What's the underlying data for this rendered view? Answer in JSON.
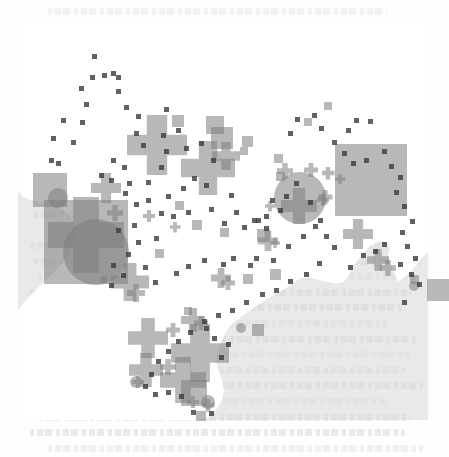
{
  "document": {
    "type": "scanned-journal-page",
    "background_color": "#fefefe",
    "text_ink_color": "#c9c9c9",
    "description": "Faint scanned body text visible above, behind and below the map figure"
  },
  "figure": {
    "title": "",
    "caption": "",
    "region": "Australia",
    "panel": {
      "x": 18,
      "y": 20,
      "width": 410,
      "height": 400,
      "ocean_color": "#d7d7d7",
      "land_color": "#ffffff",
      "opacity": 0.55
    },
    "legend_note": "three overlapping symbol classes: square, circle, cross"
  },
  "chart_data": {
    "type": "scatter",
    "title": "",
    "subtitle": "",
    "xlabel": "",
    "ylabel": "",
    "xlim": [
      0,
      410
    ],
    "ylim": [
      0,
      400
    ],
    "grid": false,
    "legend_position": "none",
    "basemap": "Australia coastline (land white, surround grey)",
    "marker_color": "#7d7d7d",
    "marker_opacity": 0.55,
    "dot_color": "#3b3b3b",
    "series": [
      {
        "name": "square",
        "shape": "square",
        "points": [
          {
            "x": 32,
            "y": 170,
            "size": 34
          },
          {
            "x": 160,
            "y": 101,
            "size": 12
          },
          {
            "x": 197,
            "y": 105,
            "size": 18
          },
          {
            "x": 204,
            "y": 118,
            "size": 22
          },
          {
            "x": 229,
            "y": 121,
            "size": 11
          },
          {
            "x": 226,
            "y": 131,
            "size": 8
          },
          {
            "x": 179,
            "y": 205,
            "size": 10
          },
          {
            "x": 206,
            "y": 212,
            "size": 9
          },
          {
            "x": 245,
            "y": 215,
            "size": 13
          },
          {
            "x": 68,
            "y": 222,
            "size": 84
          },
          {
            "x": 353,
            "y": 160,
            "size": 72
          },
          {
            "x": 396,
            "y": 259,
            "size": 9
          },
          {
            "x": 420,
            "y": 270,
            "size": 22
          },
          {
            "x": 230,
            "y": 259,
            "size": 10
          },
          {
            "x": 257,
            "y": 254,
            "size": 11
          },
          {
            "x": 170,
            "y": 291,
            "size": 8
          },
          {
            "x": 240,
            "y": 310,
            "size": 12
          },
          {
            "x": 176,
            "y": 373,
            "size": 26
          },
          {
            "x": 183,
            "y": 396,
            "size": 10
          },
          {
            "x": 260,
            "y": 138,
            "size": 9
          },
          {
            "x": 262,
            "y": 156,
            "size": 9
          },
          {
            "x": 161,
            "y": 185,
            "size": 9
          },
          {
            "x": 141,
            "y": 233,
            "size": 9
          },
          {
            "x": 290,
            "y": 102,
            "size": 8
          },
          {
            "x": 310,
            "y": 86,
            "size": 8
          }
        ]
      },
      {
        "name": "circle",
        "shape": "circle",
        "points": [
          {
            "x": 40,
            "y": 178,
            "size": 20
          },
          {
            "x": 78,
            "y": 232,
            "size": 66
          },
          {
            "x": 282,
            "y": 178,
            "size": 52
          },
          {
            "x": 223,
            "y": 308,
            "size": 10
          },
          {
            "x": 85,
            "y": 259,
            "size": 7
          },
          {
            "x": 190,
            "y": 382,
            "size": 14
          },
          {
            "x": 118,
            "y": 362,
            "size": 12
          },
          {
            "x": 396,
            "y": 266,
            "size": 10
          }
        ]
      },
      {
        "name": "cross",
        "shape": "cross",
        "points": [
          {
            "x": 139,
            "y": 125,
            "size": 60
          },
          {
            "x": 190,
            "y": 148,
            "size": 54
          },
          {
            "x": 208,
            "y": 136,
            "size": 28
          },
          {
            "x": 88,
            "y": 168,
            "size": 30
          },
          {
            "x": 97,
            "y": 193,
            "size": 16
          },
          {
            "x": 68,
            "y": 215,
            "size": 76
          },
          {
            "x": 112,
            "y": 262,
            "size": 38
          },
          {
            "x": 131,
            "y": 196,
            "size": 12
          },
          {
            "x": 157,
            "y": 207,
            "size": 11
          },
          {
            "x": 267,
            "y": 151,
            "size": 16
          },
          {
            "x": 293,
            "y": 150,
            "size": 14
          },
          {
            "x": 310,
            "y": 153,
            "size": 13
          },
          {
            "x": 322,
            "y": 159,
            "size": 10
          },
          {
            "x": 307,
            "y": 177,
            "size": 15
          },
          {
            "x": 281,
            "y": 186,
            "size": 36
          },
          {
            "x": 250,
            "y": 221,
            "size": 20
          },
          {
            "x": 305,
            "y": 180,
            "size": 12
          },
          {
            "x": 252,
            "y": 186,
            "size": 11
          },
          {
            "x": 340,
            "y": 214,
            "size": 30
          },
          {
            "x": 360,
            "y": 240,
            "size": 22
          },
          {
            "x": 370,
            "y": 248,
            "size": 16
          },
          {
            "x": 203,
            "y": 258,
            "size": 20
          },
          {
            "x": 210,
            "y": 263,
            "size": 14
          },
          {
            "x": 118,
            "y": 273,
            "size": 18
          },
          {
            "x": 175,
            "y": 300,
            "size": 24
          },
          {
            "x": 183,
            "y": 303,
            "size": 14
          },
          {
            "x": 155,
            "y": 310,
            "size": 14
          },
          {
            "x": 182,
            "y": 333,
            "size": 58
          },
          {
            "x": 130,
            "y": 318,
            "size": 40
          },
          {
            "x": 128,
            "y": 350,
            "size": 34
          },
          {
            "x": 150,
            "y": 347,
            "size": 16
          },
          {
            "x": 165,
            "y": 360,
            "size": 46
          },
          {
            "x": 175,
            "y": 382,
            "size": 12
          },
          {
            "x": 190,
            "y": 385,
            "size": 13
          },
          {
            "x": 120,
            "y": 362,
            "size": 12
          },
          {
            "x": 257,
            "y": 223,
            "size": 10
          }
        ]
      },
      {
        "name": "small point",
        "shape": "dot",
        "points": [
          {
            "x": 76,
            "y": 36,
            "size": 5
          },
          {
            "x": 74,
            "y": 57,
            "size": 5
          },
          {
            "x": 86,
            "y": 55,
            "size": 5
          },
          {
            "x": 95,
            "y": 53,
            "size": 5
          },
          {
            "x": 100,
            "y": 57,
            "size": 5
          },
          {
            "x": 63,
            "y": 68,
            "size": 5
          },
          {
            "x": 100,
            "y": 71,
            "size": 5
          },
          {
            "x": 68,
            "y": 84,
            "size": 5
          },
          {
            "x": 108,
            "y": 87,
            "size": 5
          },
          {
            "x": 45,
            "y": 100,
            "size": 5
          },
          {
            "x": 64,
            "y": 102,
            "size": 5
          },
          {
            "x": 120,
            "y": 96,
            "size": 5
          },
          {
            "x": 148,
            "y": 89,
            "size": 5
          },
          {
            "x": 35,
            "y": 118,
            "size": 5
          },
          {
            "x": 55,
            "y": 122,
            "size": 5
          },
          {
            "x": 118,
            "y": 113,
            "size": 5
          },
          {
            "x": 125,
            "y": 125,
            "size": 5
          },
          {
            "x": 33,
            "y": 140,
            "size": 5
          },
          {
            "x": 40,
            "y": 143,
            "size": 5
          },
          {
            "x": 95,
            "y": 140,
            "size": 5
          },
          {
            "x": 106,
            "y": 147,
            "size": 5
          },
          {
            "x": 83,
            "y": 155,
            "size": 5
          },
          {
            "x": 93,
            "y": 160,
            "size": 5
          },
          {
            "x": 111,
            "y": 163,
            "size": 5
          },
          {
            "x": 130,
            "y": 162,
            "size": 5
          },
          {
            "x": 143,
            "y": 147,
            "size": 5
          },
          {
            "x": 148,
            "y": 131,
            "size": 5
          },
          {
            "x": 145,
            "y": 115,
            "size": 5
          },
          {
            "x": 160,
            "y": 110,
            "size": 5
          },
          {
            "x": 168,
            "y": 128,
            "size": 5
          },
          {
            "x": 183,
            "y": 123,
            "size": 5
          },
          {
            "x": 195,
            "y": 140,
            "size": 5
          },
          {
            "x": 176,
            "y": 158,
            "size": 5
          },
          {
            "x": 165,
            "y": 168,
            "size": 5
          },
          {
            "x": 188,
            "y": 165,
            "size": 5
          },
          {
            "x": 150,
            "y": 176,
            "size": 5
          },
          {
            "x": 118,
            "y": 184,
            "size": 5
          },
          {
            "x": 107,
            "y": 173,
            "size": 5
          },
          {
            "x": 130,
            "y": 180,
            "size": 5
          },
          {
            "x": 143,
            "y": 193,
            "size": 5
          },
          {
            "x": 155,
            "y": 196,
            "size": 5
          },
          {
            "x": 170,
            "y": 192,
            "size": 5
          },
          {
            "x": 193,
            "y": 189,
            "size": 5
          },
          {
            "x": 213,
            "y": 175,
            "size": 5
          },
          {
            "x": 218,
            "y": 192,
            "size": 5
          },
          {
            "x": 206,
            "y": 203,
            "size": 5
          },
          {
            "x": 226,
            "y": 207,
            "size": 5
          },
          {
            "x": 240,
            "y": 200,
            "size": 5
          },
          {
            "x": 248,
            "y": 208,
            "size": 5
          },
          {
            "x": 116,
            "y": 205,
            "size": 5
          },
          {
            "x": 100,
            "y": 210,
            "size": 5
          },
          {
            "x": 120,
            "y": 222,
            "size": 5
          },
          {
            "x": 138,
            "y": 218,
            "size": 5
          },
          {
            "x": 110,
            "y": 234,
            "size": 5
          },
          {
            "x": 95,
            "y": 245,
            "size": 5
          },
          {
            "x": 127,
            "y": 247,
            "size": 5
          },
          {
            "x": 105,
            "y": 255,
            "size": 5
          },
          {
            "x": 93,
            "y": 265,
            "size": 5
          },
          {
            "x": 137,
            "y": 262,
            "size": 5
          },
          {
            "x": 158,
            "y": 253,
            "size": 5
          },
          {
            "x": 170,
            "y": 246,
            "size": 5
          },
          {
            "x": 186,
            "y": 240,
            "size": 5
          },
          {
            "x": 205,
            "y": 244,
            "size": 5
          },
          {
            "x": 215,
            "y": 238,
            "size": 5
          },
          {
            "x": 232,
            "y": 245,
            "size": 5
          },
          {
            "x": 238,
            "y": 238,
            "size": 5
          },
          {
            "x": 255,
            "y": 240,
            "size": 5
          },
          {
            "x": 270,
            "y": 226,
            "size": 5
          },
          {
            "x": 285,
            "y": 216,
            "size": 5
          },
          {
            "x": 297,
            "y": 206,
            "size": 5
          },
          {
            "x": 292,
            "y": 182,
            "size": 5
          },
          {
            "x": 278,
            "y": 163,
            "size": 5
          },
          {
            "x": 268,
            "y": 176,
            "size": 5
          },
          {
            "x": 262,
            "y": 190,
            "size": 5
          },
          {
            "x": 248,
            "y": 196,
            "size": 5
          },
          {
            "x": 316,
            "y": 122,
            "size": 5
          },
          {
            "x": 330,
            "y": 110,
            "size": 5
          },
          {
            "x": 338,
            "y": 100,
            "size": 5
          },
          {
            "x": 352,
            "y": 101,
            "size": 5
          },
          {
            "x": 326,
            "y": 133,
            "size": 5
          },
          {
            "x": 335,
            "y": 143,
            "size": 5
          },
          {
            "x": 348,
            "y": 140,
            "size": 5
          },
          {
            "x": 366,
            "y": 131,
            "size": 5
          },
          {
            "x": 373,
            "y": 146,
            "size": 5
          },
          {
            "x": 382,
            "y": 157,
            "size": 5
          },
          {
            "x": 378,
            "y": 172,
            "size": 5
          },
          {
            "x": 386,
            "y": 186,
            "size": 5
          },
          {
            "x": 394,
            "y": 201,
            "size": 5
          },
          {
            "x": 384,
            "y": 212,
            "size": 5
          },
          {
            "x": 389,
            "y": 226,
            "size": 5
          },
          {
            "x": 397,
            "y": 238,
            "size": 5
          },
          {
            "x": 382,
            "y": 244,
            "size": 5
          },
          {
            "x": 393,
            "y": 254,
            "size": 5
          },
          {
            "x": 401,
            "y": 264,
            "size": 5
          },
          {
            "x": 386,
            "y": 282,
            "size": 5
          },
          {
            "x": 332,
            "y": 247,
            "size": 5
          },
          {
            "x": 345,
            "y": 235,
            "size": 5
          },
          {
            "x": 357,
            "y": 231,
            "size": 5
          },
          {
            "x": 366,
            "y": 224,
            "size": 5
          },
          {
            "x": 302,
            "y": 200,
            "size": 5
          },
          {
            "x": 308,
            "y": 216,
            "size": 5
          },
          {
            "x": 316,
            "y": 227,
            "size": 5
          },
          {
            "x": 301,
            "y": 243,
            "size": 5
          },
          {
            "x": 288,
            "y": 254,
            "size": 5
          },
          {
            "x": 272,
            "y": 261,
            "size": 5
          },
          {
            "x": 258,
            "y": 270,
            "size": 5
          },
          {
            "x": 244,
            "y": 274,
            "size": 5
          },
          {
            "x": 228,
            "y": 282,
            "size": 5
          },
          {
            "x": 214,
            "y": 290,
            "size": 5
          },
          {
            "x": 200,
            "y": 295,
            "size": 5
          },
          {
            "x": 186,
            "y": 301,
            "size": 5
          },
          {
            "x": 172,
            "y": 312,
            "size": 5
          },
          {
            "x": 160,
            "y": 321,
            "size": 5
          },
          {
            "x": 150,
            "y": 331,
            "size": 5
          },
          {
            "x": 140,
            "y": 341,
            "size": 5
          },
          {
            "x": 133,
            "y": 354,
            "size": 5
          },
          {
            "x": 127,
            "y": 366,
            "size": 5
          },
          {
            "x": 137,
            "y": 374,
            "size": 5
          },
          {
            "x": 150,
            "y": 372,
            "size": 5
          },
          {
            "x": 163,
            "y": 376,
            "size": 5
          },
          {
            "x": 175,
            "y": 392,
            "size": 5
          },
          {
            "x": 193,
            "y": 393,
            "size": 5
          },
          {
            "x": 203,
            "y": 337,
            "size": 5
          },
          {
            "x": 210,
            "y": 324,
            "size": 5
          },
          {
            "x": 196,
            "y": 318,
            "size": 5
          },
          {
            "x": 188,
            "y": 308,
            "size": 5
          },
          {
            "x": 236,
            "y": 200,
            "size": 5
          },
          {
            "x": 254,
            "y": 180,
            "size": 5
          },
          {
            "x": 272,
            "y": 113,
            "size": 5
          },
          {
            "x": 279,
            "y": 99,
            "size": 5
          },
          {
            "x": 296,
            "y": 95,
            "size": 5
          },
          {
            "x": 303,
            "y": 108,
            "size": 5
          }
        ]
      }
    ]
  }
}
